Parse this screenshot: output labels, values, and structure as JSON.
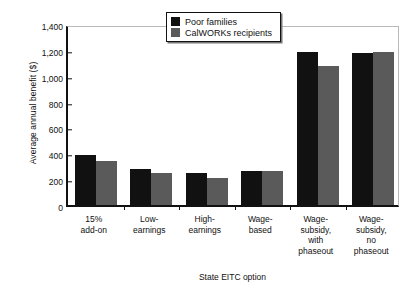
{
  "chart_data": {
    "type": "bar",
    "title": "",
    "xlabel": "State EITC option",
    "ylabel": "Average annual benefit ($)",
    "ylim": [
      0,
      1400
    ],
    "yticks": [
      0,
      200,
      400,
      600,
      800,
      1000,
      1200,
      1400
    ],
    "ytick_labels": [
      "0",
      "200",
      "400",
      "600",
      "800",
      "1,000",
      "1,200",
      "1,400"
    ],
    "grid": false,
    "legend_position": "top-center",
    "categories": [
      "15%\nadd-on",
      "Low-\nearnings",
      "High-\nearnings",
      "Wage-\nbased",
      "Wage-\nsubsidy,\nwith\nphaseout",
      "Wage-\nsubsidy,\nno\nphaseout"
    ],
    "series": [
      {
        "name": "Poor families",
        "color": "#111111",
        "values": [
          390,
          275,
          245,
          262,
          1180,
          1175
        ]
      },
      {
        "name": "CalWORKs recipients",
        "color": "#5a5a5a",
        "values": [
          340,
          250,
          212,
          263,
          1075,
          1185
        ]
      }
    ]
  }
}
